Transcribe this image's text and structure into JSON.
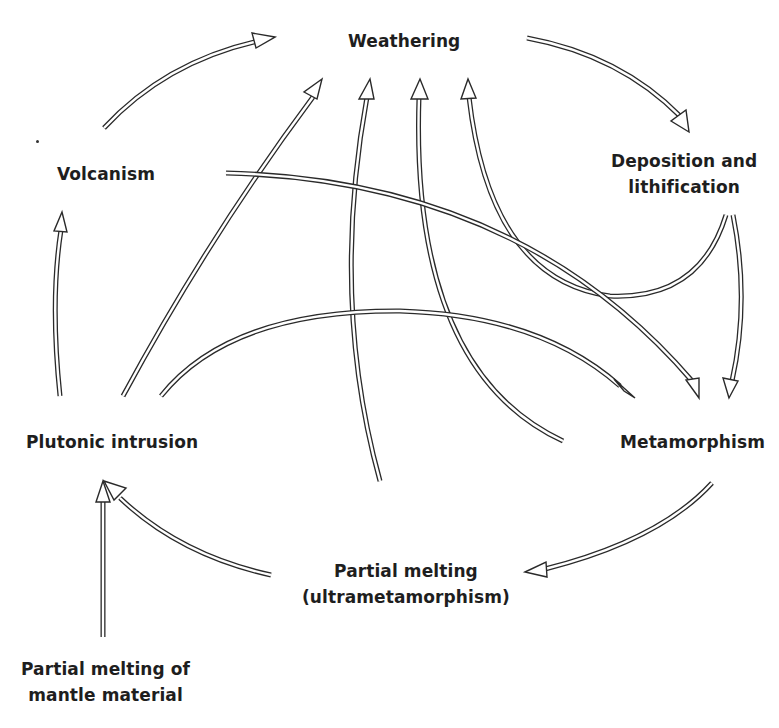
{
  "diagram": {
    "colors": {
      "line": "#2a2a2a",
      "text": "#1e1e1e",
      "background": "#ffffff"
    },
    "nodes": {
      "weathering": {
        "lines": [
          "Weathering"
        ]
      },
      "volcanism": {
        "lines": [
          "Volcanism"
        ]
      },
      "deposition": {
        "lines": [
          "Deposition and",
          "lithification"
        ]
      },
      "plutonic": {
        "lines": [
          "Plutonic intrusion"
        ]
      },
      "metamorphism": {
        "lines": [
          "Metamorphism"
        ]
      },
      "partial_melting": {
        "lines": [
          "Partial melting",
          "(ultrametamorphism)"
        ]
      },
      "mantle": {
        "lines": [
          "Partial melting of",
          "mantle material"
        ]
      }
    },
    "edges": [
      {
        "from": "Volcanism",
        "to": "Weathering"
      },
      {
        "from": "Weathering",
        "to": "Deposition and lithification"
      },
      {
        "from": "Plutonic intrusion",
        "to": "Weathering"
      },
      {
        "from": "Partial melting (ultrametamorphism)",
        "to": "Weathering"
      },
      {
        "from": "Metamorphism",
        "to": "Weathering"
      },
      {
        "from": "Deposition and lithification",
        "to": "Weathering"
      },
      {
        "from": "Volcanism",
        "to": "Metamorphism"
      },
      {
        "from": "Deposition and lithification",
        "to": "Metamorphism"
      },
      {
        "from": "Plutonic intrusion",
        "to": "Metamorphism"
      },
      {
        "from": "Plutonic intrusion",
        "to": "Volcanism"
      },
      {
        "from": "Metamorphism",
        "to": "Partial melting (ultrametamorphism)"
      },
      {
        "from": "Partial melting (ultrametamorphism)",
        "to": "Plutonic intrusion"
      },
      {
        "from": "Partial melting of mantle material",
        "to": "Plutonic intrusion"
      }
    ]
  }
}
